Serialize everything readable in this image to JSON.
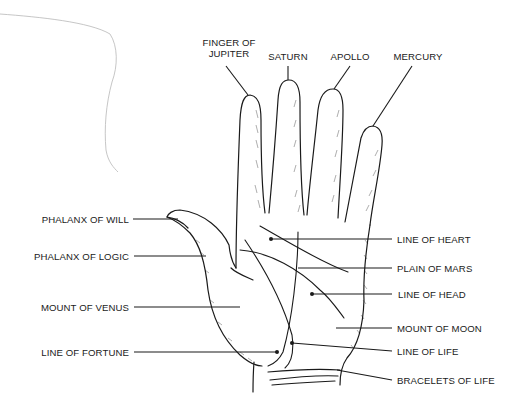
{
  "diagram": {
    "colors": {
      "ink": "#1a1a1a",
      "background": "#ffffff",
      "stray_line": "#b8b8b8"
    },
    "top_labels": [
      {
        "id": "jupiter",
        "line1": "FINGER OF",
        "line2": "JUPITER"
      },
      {
        "id": "saturn",
        "text": "SATURN"
      },
      {
        "id": "apollo",
        "text": "APOLLO"
      },
      {
        "id": "mercury",
        "text": "MERCURY"
      }
    ],
    "left_labels": [
      {
        "id": "phalanx-will",
        "text": "PHALANX OF WILL"
      },
      {
        "id": "phalanx-logic",
        "text": "PHALANX OF LOGIC"
      },
      {
        "id": "mount-venus",
        "text": "MOUNT OF VENUS"
      },
      {
        "id": "line-fortune",
        "text": "LINE OF FORTUNE"
      }
    ],
    "right_labels": [
      {
        "id": "line-heart",
        "text": "LINE OF HEART"
      },
      {
        "id": "plain-mars",
        "text": "PLAIN OF MARS"
      },
      {
        "id": "line-head",
        "text": "LINE OF HEAD"
      },
      {
        "id": "mount-moon",
        "text": "MOUNT OF MOON"
      },
      {
        "id": "line-life",
        "text": "LINE OF LIFE"
      },
      {
        "id": "bracelets-life",
        "text": "BRACELETS OF LIFE"
      }
    ]
  }
}
